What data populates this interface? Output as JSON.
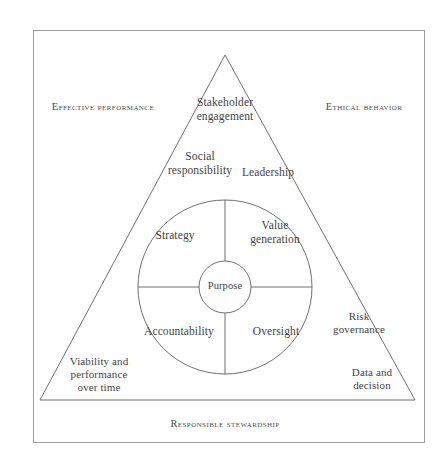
{
  "figure": {
    "type": "framework-diagram",
    "shape": "triangle-with-concentric-circles",
    "outer_frame": true,
    "caption": "",
    "colors": {
      "stroke": "#6f6f6f",
      "frame_stroke": "#9a9a9a",
      "text": "#3f3f3f",
      "background": "#ffffff"
    }
  },
  "edge_labels": {
    "left": "Effective performance",
    "right": "Ethical behavior",
    "bottom": "Responsible stewardship"
  },
  "triangle_labels": {
    "apex": "Stakeholder\nengagement",
    "upper_left": "Social\nresponsibility",
    "upper_right": "Leadership",
    "lower_left": "Viability and\nperformance\nover time",
    "lower_right_upper": "Risk\ngovernance",
    "lower_right_lower": "Data and\ndecision"
  },
  "circle_quadrants": {
    "top_left": "Strategy",
    "top_right": "Value\ngeneration",
    "bottom_left": "Accountability",
    "bottom_right": "Oversight"
  },
  "core": {
    "label": "Purpose"
  }
}
